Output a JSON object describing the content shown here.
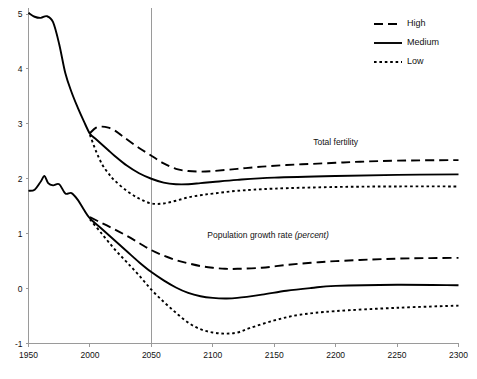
{
  "chart_data": {
    "type": "line",
    "title": "",
    "xlabel": "",
    "ylabel": "",
    "xlim": [
      1950,
      2300
    ],
    "ylim": [
      -1,
      5
    ],
    "xticks": [
      1950,
      2000,
      2050,
      2100,
      2150,
      2200,
      2250,
      2300
    ],
    "yticks": [
      -1,
      0,
      1,
      2,
      3,
      4,
      5
    ],
    "grid": false,
    "legend_position": "top-right",
    "annotations": [
      {
        "name": "total-fertility",
        "text": "Total fertility",
        "x": 2200,
        "y": 2.62
      },
      {
        "name": "population-growth-rate",
        "text": "Population growth rate ",
        "text_italic": "(percent)",
        "x": 2145,
        "y": 0.93
      }
    ],
    "marker_lines": [
      {
        "name": "year-2050-divider",
        "x": 2050
      }
    ],
    "groups": [
      {
        "name": "Total fertility",
        "series": [
          {
            "name": "High",
            "style": "dashed",
            "x": [
              2000,
              2005,
              2010,
              2015,
              2020,
              2025,
              2030,
              2040,
              2050,
              2060,
              2070,
              2080,
              2090,
              2100,
              2120,
              2140,
              2160,
              2180,
              2200,
              2220,
              2250,
              2300
            ],
            "values": [
              2.83,
              2.93,
              2.95,
              2.93,
              2.88,
              2.8,
              2.72,
              2.56,
              2.42,
              2.28,
              2.18,
              2.14,
              2.13,
              2.14,
              2.18,
              2.22,
              2.25,
              2.27,
              2.29,
              2.31,
              2.33,
              2.34
            ]
          },
          {
            "name": "Medium",
            "style": "solid",
            "x": [
              1950,
              1955,
              1960,
              1965,
              1970,
              1975,
              1980,
              1985,
              1990,
              1995,
              2000,
              2005,
              2010,
              2015,
              2020,
              2030,
              2040,
              2050,
              2060,
              2070,
              2080,
              2090,
              2100,
              2120,
              2150,
              2200,
              2250,
              2300
            ],
            "values": [
              5.02,
              4.95,
              4.93,
              4.96,
              4.85,
              4.45,
              3.92,
              3.58,
              3.3,
              3.05,
              2.82,
              2.72,
              2.62,
              2.52,
              2.42,
              2.24,
              2.1,
              2.0,
              1.93,
              1.9,
              1.9,
              1.92,
              1.94,
              1.98,
              2.02,
              2.05,
              2.07,
              2.08
            ]
          },
          {
            "name": "Low",
            "style": "dotted",
            "x": [
              2000,
              2005,
              2010,
              2015,
              2020,
              2030,
              2040,
              2050,
              2060,
              2070,
              2080,
              2090,
              2100,
              2120,
              2150,
              2200,
              2250,
              2300
            ],
            "values": [
              2.8,
              2.5,
              2.26,
              2.1,
              1.97,
              1.78,
              1.64,
              1.55,
              1.55,
              1.6,
              1.66,
              1.7,
              1.73,
              1.78,
              1.82,
              1.85,
              1.86,
              1.86
            ]
          }
        ]
      },
      {
        "name": "Population growth rate (percent)",
        "series": [
          {
            "name": "High",
            "style": "dashed",
            "x": [
              2000,
              2010,
              2020,
              2030,
              2040,
              2050,
              2060,
              2070,
              2080,
              2090,
              2100,
              2110,
              2120,
              2140,
              2160,
              2180,
              2200,
              2230,
              2260,
              2300
            ],
            "values": [
              1.3,
              1.19,
              1.08,
              0.96,
              0.83,
              0.7,
              0.6,
              0.52,
              0.46,
              0.41,
              0.38,
              0.36,
              0.36,
              0.38,
              0.43,
              0.47,
              0.5,
              0.53,
              0.55,
              0.56
            ]
          },
          {
            "name": "Medium",
            "style": "solid",
            "x": [
              1950,
              1955,
              1960,
              1963,
              1966,
              1970,
              1975,
              1980,
              1985,
              1990,
              1995,
              2000,
              2010,
              2020,
              2030,
              2040,
              2050,
              2060,
              2070,
              2080,
              2090,
              2100,
              2110,
              2120,
              2140,
              2160,
              2180,
              2200,
              2250,
              2300
            ],
            "values": [
              1.78,
              1.8,
              1.95,
              2.05,
              1.92,
              1.88,
              1.9,
              1.73,
              1.74,
              1.62,
              1.44,
              1.28,
              1.08,
              0.88,
              0.68,
              0.48,
              0.3,
              0.15,
              0.02,
              -0.08,
              -0.14,
              -0.17,
              -0.18,
              -0.17,
              -0.11,
              -0.04,
              0.01,
              0.05,
              0.07,
              0.06
            ]
          },
          {
            "name": "Low",
            "style": "dotted",
            "x": [
              2000,
              2010,
              2020,
              2030,
              2040,
              2050,
              2060,
              2070,
              2080,
              2090,
              2100,
              2110,
              2120,
              2130,
              2150,
              2170,
              2200,
              2250,
              2300
            ],
            "values": [
              1.26,
              0.99,
              0.72,
              0.48,
              0.24,
              -0.02,
              -0.24,
              -0.44,
              -0.62,
              -0.74,
              -0.8,
              -0.82,
              -0.8,
              -0.72,
              -0.58,
              -0.48,
              -0.41,
              -0.35,
              -0.31
            ]
          }
        ]
      }
    ],
    "legend": [
      {
        "label": "High",
        "style": "dashed"
      },
      {
        "label": "Medium",
        "style": "solid"
      },
      {
        "label": "Low",
        "style": "dotted"
      }
    ]
  }
}
